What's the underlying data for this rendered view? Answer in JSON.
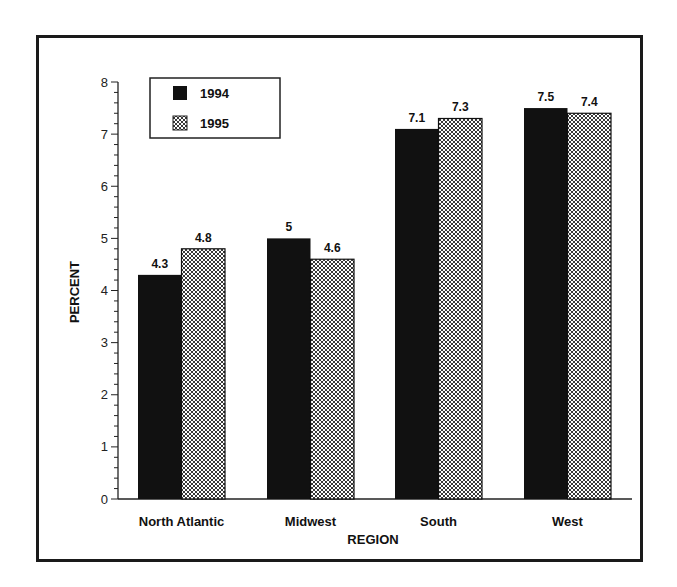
{
  "chart_data": {
    "type": "bar",
    "title": "",
    "xlabel": "REGION",
    "ylabel": "PERCENT",
    "categories": [
      "North Atlantic",
      "Midwest",
      "South",
      "West"
    ],
    "series": [
      {
        "name": "1994",
        "values": [
          4.3,
          5,
          7.1,
          7.5
        ],
        "fill": "solid",
        "color": "#111111"
      },
      {
        "name": "1995",
        "values": [
          4.8,
          4.6,
          7.3,
          7.4
        ],
        "fill": "crosshatch",
        "color": "#111111"
      }
    ],
    "value_labels": [
      [
        "4.3",
        "5",
        "7.1",
        "7.5"
      ],
      [
        "4.8",
        "4.6",
        "7.3",
        "7.4"
      ]
    ],
    "ylim": [
      0,
      8
    ],
    "yticks": [
      0,
      1,
      2,
      3,
      4,
      5,
      6,
      7,
      8
    ],
    "minor_tick_step": 0.2,
    "grid": false,
    "legend": {
      "position": "upper-left",
      "entries": [
        "1994",
        "1995"
      ]
    }
  }
}
